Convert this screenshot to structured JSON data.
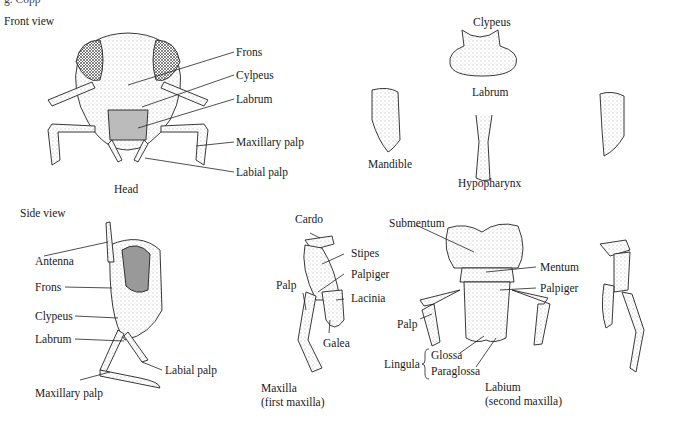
{
  "figure": {
    "clipped_top_text": "g. Copp",
    "sections": {
      "front_view": {
        "title": "Front view",
        "caption": "Head",
        "labels": [
          "Frons",
          "Cylpeus",
          "Labrum",
          "Maxillary palp",
          "Labial palp"
        ]
      },
      "mouthparts_top": {
        "labels": {
          "clypeus": "Clypeus",
          "labrum": "Labrum",
          "mandible": "Mandible",
          "hypopharynx": "Hypopharynx"
        }
      },
      "side_view": {
        "title": "Side view",
        "labels": [
          "Antenna",
          "Frons",
          "Clypeus",
          "Labrum",
          "Labial palp",
          "Maxillary palp"
        ]
      },
      "maxilla": {
        "labels": [
          "Cardo",
          "Stipes",
          "Palpiger",
          "Palp",
          "Lacinia",
          "Galea"
        ],
        "caption_line1": "Maxilla",
        "caption_line2": "(first maxilla)"
      },
      "labium": {
        "labels": [
          "Submentum",
          "Mentum",
          "Palpiger",
          "Palp"
        ],
        "lingula": {
          "group": "Lingula",
          "items": [
            "Glossa",
            "Paraglossa"
          ]
        },
        "caption_line1": "Labium",
        "caption_line2": "(second maxilla)"
      }
    }
  }
}
